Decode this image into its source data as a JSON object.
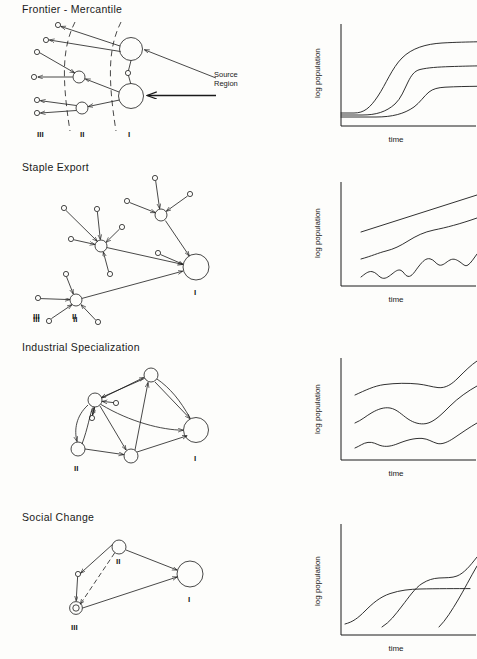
{
  "figure": {
    "background": "#fdfdfb",
    "ink": "#1a1a1a",
    "width": 477,
    "height": 659
  },
  "panels": [
    {
      "id": "frontier-mercantile",
      "title": "Frontier - Mercantile",
      "region_labels": [
        "III",
        "II",
        "I"
      ],
      "annotation": {
        "line1": "Source",
        "line2": "Region"
      }
    },
    {
      "id": "staple-export",
      "title": "Staple Export",
      "region_labels": [
        "III",
        "II",
        "I"
      ]
    },
    {
      "id": "industrial-specialization",
      "title": "Industrial Specialization",
      "region_labels": [
        "II",
        "I"
      ]
    },
    {
      "id": "social-change",
      "title": "Social Change",
      "region_labels": [
        "II",
        "III",
        "I"
      ]
    }
  ],
  "charts": [
    {
      "id": "chart-frontier-mercantile",
      "type": "line",
      "title": "",
      "xlabel": "time",
      "ylabel": "log population",
      "grid": false,
      "legend": false,
      "xlim": [
        0,
        100
      ],
      "ylim": [
        0,
        100
      ],
      "series": [
        {
          "name": "Region I",
          "x": [
            0,
            10,
            20,
            28,
            34,
            40,
            46,
            52,
            58,
            66,
            76,
            88,
            100
          ],
          "y": [
            8,
            8,
            9,
            12,
            18,
            30,
            46,
            60,
            70,
            76,
            80,
            82,
            83
          ]
        },
        {
          "name": "Region II",
          "x": [
            0,
            14,
            26,
            36,
            44,
            50,
            54,
            57,
            60,
            64,
            72,
            84,
            100
          ],
          "y": [
            7,
            7,
            7,
            9,
            13,
            20,
            33,
            48,
            55,
            58,
            62,
            65,
            67
          ]
        },
        {
          "name": "Region III",
          "x": [
            0,
            18,
            34,
            48,
            58,
            64,
            68,
            71,
            74,
            80,
            90,
            100
          ],
          "y": [
            6,
            6,
            6,
            7,
            9,
            14,
            24,
            36,
            42,
            44,
            47,
            49
          ]
        }
      ]
    },
    {
      "id": "chart-staple-export",
      "type": "line",
      "title": "",
      "xlabel": "time",
      "ylabel": "log population",
      "grid": false,
      "legend": false,
      "xlim": [
        0,
        100
      ],
      "ylim": [
        0,
        100
      ],
      "series": [
        {
          "name": "Region I",
          "x": [
            10,
            30,
            50,
            70,
            90,
            100
          ],
          "y": [
            56,
            63,
            70,
            77,
            84,
            88
          ]
        },
        {
          "name": "Region II",
          "x": [
            10,
            20,
            28,
            36,
            44,
            52,
            60,
            68,
            76,
            84,
            92,
            100
          ],
          "y": [
            32,
            36,
            41,
            42,
            45,
            50,
            55,
            57,
            57,
            60,
            64,
            68
          ]
        },
        {
          "name": "Region III",
          "x": [
            10,
            16,
            22,
            28,
            34,
            40,
            46,
            52,
            58,
            64,
            70,
            76,
            82,
            88,
            94,
            100
          ],
          "y": [
            12,
            18,
            14,
            20,
            15,
            22,
            17,
            26,
            20,
            32,
            27,
            34,
            29,
            36,
            31,
            38
          ]
        }
      ]
    },
    {
      "id": "chart-industrial-specialization",
      "type": "line",
      "title": "",
      "xlabel": "time",
      "ylabel": "log population",
      "grid": false,
      "legend": false,
      "xlim": [
        0,
        100
      ],
      "ylim": [
        0,
        100
      ],
      "series": [
        {
          "name": "Region I",
          "x": [
            8,
            20,
            32,
            44,
            56,
            66,
            76,
            86,
            96,
            100
          ],
          "y": [
            60,
            66,
            70,
            71,
            70,
            68,
            72,
            79,
            85,
            87
          ]
        },
        {
          "name": "Region II",
          "x": [
            8,
            20,
            30,
            40,
            50,
            60,
            70,
            80,
            90,
            100
          ],
          "y": [
            38,
            44,
            50,
            51,
            47,
            42,
            41,
            46,
            54,
            60
          ]
        },
        {
          "name": "Region III",
          "x": [
            8,
            18,
            26,
            34,
            44,
            56,
            66,
            76,
            86,
            96,
            100
          ],
          "y": [
            16,
            20,
            23,
            21,
            22,
            26,
            27,
            25,
            24,
            28,
            32
          ]
        }
      ]
    },
    {
      "id": "chart-social-change",
      "type": "line",
      "title": "",
      "xlabel": "time",
      "ylabel": "log population",
      "grid": false,
      "legend": false,
      "xlim": [
        0,
        100
      ],
      "ylim": [
        0,
        100
      ],
      "series": [
        {
          "name": "Region I",
          "x": [
            4,
            14,
            24,
            34,
            44,
            54,
            62,
            72,
            84,
            96,
            100
          ],
          "y": [
            10,
            16,
            26,
            38,
            46,
            50,
            51,
            51,
            51,
            51,
            51
          ]
        },
        {
          "name": "Region II",
          "x": [
            22,
            30,
            38,
            46,
            54,
            62,
            70,
            80,
            90,
            100
          ],
          "y": [
            8,
            18,
            32,
            46,
            56,
            60,
            61,
            60,
            62,
            70
          ]
        },
        {
          "name": "Region III",
          "x": [
            60,
            66,
            72,
            78,
            84,
            90,
            96,
            100
          ],
          "y": [
            8,
            18,
            30,
            42,
            54,
            64,
            73,
            78
          ]
        }
      ]
    }
  ]
}
